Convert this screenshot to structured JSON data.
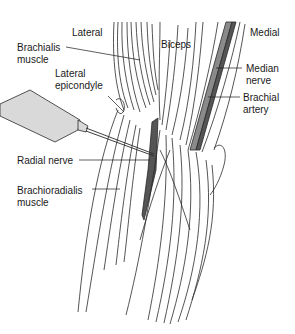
{
  "figure": {
    "type": "anatomical illustration",
    "labels": [
      {
        "id": "lateral",
        "text": "Lateral"
      },
      {
        "id": "brachialis",
        "text": "Brachialis\nmuscle"
      },
      {
        "id": "lateral-epicondyle",
        "text": "Lateral\nepicondyle"
      },
      {
        "id": "radial-nerve",
        "text": "Radial nerve"
      },
      {
        "id": "brachioradialis",
        "text": "Brachioradialis\nmuscle"
      },
      {
        "id": "biceps",
        "text": "Biceps"
      },
      {
        "id": "medial",
        "text": "Medial"
      },
      {
        "id": "median-nerve",
        "text": "Median\nnerve"
      },
      {
        "id": "brachial-artery",
        "text": "Brachial\nartery"
      }
    ],
    "colors": {
      "line": "#2a2a2a",
      "nerve_fill": "#555555",
      "artery_fill": "#8a8a8a",
      "syringe_fill": "#d9d9d9",
      "background": "#ffffff"
    }
  }
}
